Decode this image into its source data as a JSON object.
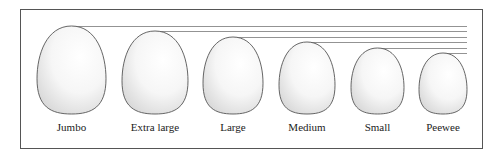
{
  "diagram": {
    "eggs": [
      {
        "label": "Jumbo",
        "cx": 71,
        "left": 37,
        "right": 106,
        "top": 26,
        "bottom": 114
      },
      {
        "label": "Extra large",
        "cx": 155,
        "left": 122,
        "right": 188,
        "top": 31,
        "bottom": 114
      },
      {
        "label": "Large",
        "cx": 233,
        "left": 203,
        "right": 263,
        "top": 37,
        "bottom": 114
      },
      {
        "label": "Medium",
        "cx": 307,
        "left": 279,
        "right": 335,
        "top": 42,
        "bottom": 114
      },
      {
        "label": "Small",
        "cx": 378,
        "left": 351,
        "right": 404,
        "top": 48,
        "bottom": 114
      },
      {
        "label": "Peewee",
        "cx": 443,
        "left": 419,
        "right": 467,
        "top": 53,
        "bottom": 114
      }
    ],
    "line_end_x": 467,
    "colors": {
      "outline": "#555555",
      "shade": "#d8d8d8",
      "frame": "#555555"
    }
  }
}
